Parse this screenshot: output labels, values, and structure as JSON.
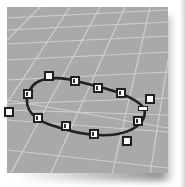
{
  "viewport": {
    "name": "Perspective",
    "background": "#a9a9a9",
    "grid_color": "#cfcfcf",
    "curve_color": "#222222",
    "control_point_fill": "#ffffff",
    "control_point_border": "#202020"
  },
  "curve": {
    "type": "closed-curve",
    "control_points": [
      {
        "id": "cp-1",
        "x": 49,
        "y": 76,
        "marked": false
      },
      {
        "id": "cp-2",
        "x": 75,
        "y": 81,
        "marked": true
      },
      {
        "id": "cp-3",
        "x": 98,
        "y": 88,
        "marked": true
      },
      {
        "id": "cp-4",
        "x": 121,
        "y": 93,
        "marked": true
      },
      {
        "id": "cp-5",
        "x": 150,
        "y": 99,
        "marked": false
      },
      {
        "id": "cp-6",
        "x": 138,
        "y": 121,
        "marked": true
      },
      {
        "id": "cp-7",
        "x": 127,
        "y": 141,
        "marked": false
      },
      {
        "id": "cp-8",
        "x": 94,
        "y": 134,
        "marked": true
      },
      {
        "id": "cp-9",
        "x": 66,
        "y": 126,
        "marked": true
      },
      {
        "id": "cp-10",
        "x": 38,
        "y": 118,
        "marked": true
      },
      {
        "id": "cp-11",
        "x": 28,
        "y": 94,
        "marked": true
      },
      {
        "id": "cp-12",
        "x": 10,
        "y": 113,
        "marked": false
      }
    ],
    "seam_marker": {
      "x": 143,
      "y": 108
    }
  },
  "caption": "· · · · · · · · · · ·"
}
